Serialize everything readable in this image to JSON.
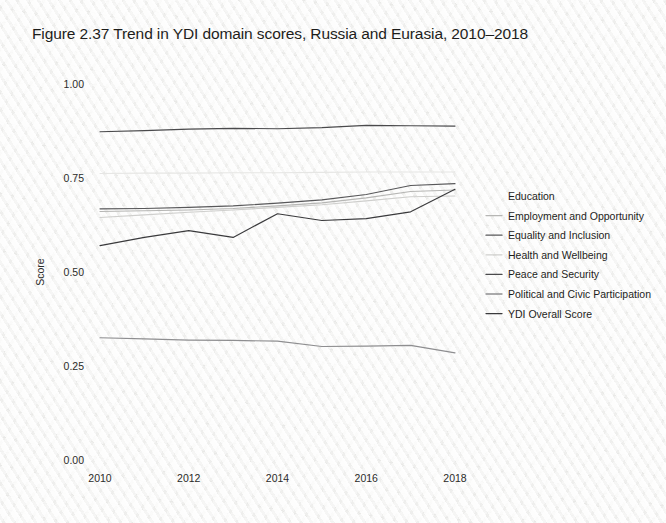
{
  "figure": {
    "title": "Figure 2.37   Trend in YDI domain scores, Russia and Eurasia, 2010–2018"
  },
  "axes": {
    "y_label": "Score",
    "y_ticks": [
      "1.00",
      "0.75",
      "0.50",
      "0.25",
      "0.00"
    ],
    "x_ticks": [
      "2010",
      "2012",
      "2014",
      "2016",
      "2018"
    ]
  },
  "legend": {
    "items": [
      {
        "label": "Education",
        "color": "#e6e6e4",
        "swatch": false
      },
      {
        "label": "Employment and Opportunity",
        "color": "#b6b6b4",
        "swatch": true
      },
      {
        "label": "Equality and Inclusion",
        "color": "#58585a",
        "swatch": true
      },
      {
        "label": "Health and Wellbeing",
        "color": "#cfcfcd",
        "swatch": true
      },
      {
        "label": "Peace and Security",
        "color": "#4a4a4c",
        "swatch": true
      },
      {
        "label": "Political and Civic Participation",
        "color": "#8e8e90",
        "swatch": true
      },
      {
        "label": "YDI Overall Score",
        "color": "#3a3a3c",
        "swatch": true
      }
    ]
  },
  "chart_data": {
    "type": "line",
    "title": "Figure 2.37   Trend in YDI domain scores, Russia and Eurasia, 2010–2018",
    "xlabel": "",
    "ylabel": "Score",
    "xlim": [
      2010,
      2018
    ],
    "ylim": [
      0.0,
      1.0
    ],
    "grid": false,
    "legend_position": "right",
    "x": [
      2010,
      2011,
      2012,
      2013,
      2014,
      2015,
      2016,
      2017,
      2018
    ],
    "series": [
      {
        "name": "Peace and Security",
        "color": "#4a4a4c",
        "values": [
          0.873,
          0.876,
          0.88,
          0.882,
          0.881,
          0.884,
          0.89,
          0.889,
          0.888
        ]
      },
      {
        "name": "Education",
        "color": "#e6e6e4",
        "values": [
          0.762,
          0.763,
          0.763,
          0.764,
          0.764,
          0.765,
          0.766,
          0.766,
          0.766
        ]
      },
      {
        "name": "Equality and Inclusion",
        "color": "#58585a",
        "values": [
          0.668,
          0.669,
          0.672,
          0.676,
          0.683,
          0.692,
          0.706,
          0.73,
          0.735
        ]
      },
      {
        "name": "Employment and Opportunity",
        "color": "#b6b6b4",
        "values": [
          0.661,
          0.663,
          0.665,
          0.669,
          0.676,
          0.684,
          0.697,
          0.714,
          0.718
        ]
      },
      {
        "name": "Health and Wellbeing",
        "color": "#cfcfcd",
        "values": [
          0.645,
          0.652,
          0.659,
          0.665,
          0.672,
          0.679,
          0.689,
          0.7,
          0.702
        ]
      },
      {
        "name": "YDI Overall Score",
        "color": "#3a3a3c",
        "values": [
          0.57,
          0.592,
          0.61,
          0.592,
          0.655,
          0.637,
          0.642,
          0.66,
          0.72
        ]
      },
      {
        "name": "Political and Civic Participation",
        "color": "#8e8e90",
        "values": [
          0.325,
          0.322,
          0.319,
          0.318,
          0.316,
          0.302,
          0.303,
          0.305,
          0.285
        ]
      }
    ]
  }
}
